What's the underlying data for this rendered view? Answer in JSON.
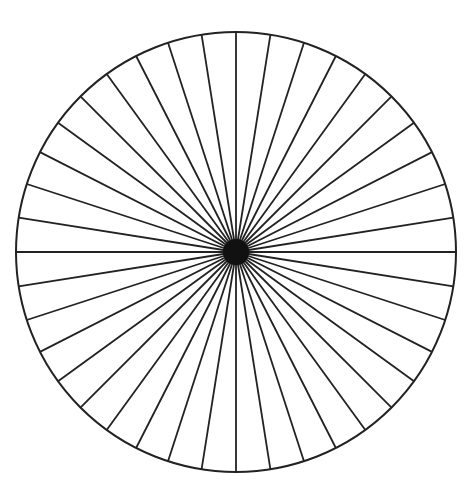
{
  "diagram": {
    "type": "radial-spoke-wheel",
    "center": [
      236,
      252
    ],
    "radius": 220,
    "spoke_count": 40,
    "spoke_angle_deg": 9,
    "stroke_color": "#222222",
    "background_color": "#ffffff"
  }
}
